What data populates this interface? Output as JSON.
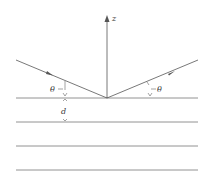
{
  "diagram": {
    "labels": {
      "axis": "z",
      "angle_incident": "θ",
      "angle_reflected": "θ",
      "spacing": "d"
    },
    "colors": {
      "line": "#555555",
      "text": "#333333",
      "background": "#ffffff"
    },
    "layers": [
      98,
      122,
      146,
      170
    ]
  }
}
